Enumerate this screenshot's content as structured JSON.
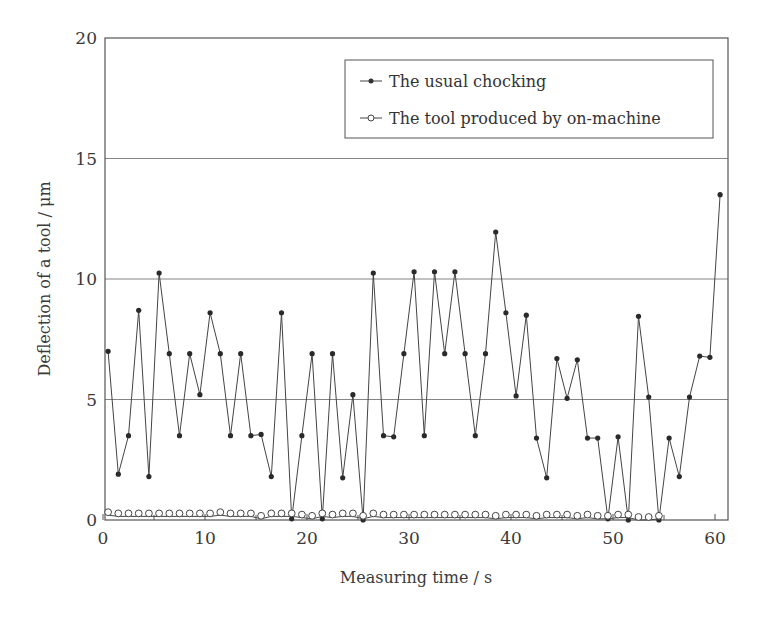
{
  "chart_data": {
    "type": "line",
    "title": "",
    "xlabel": "Measuring time / s",
    "ylabel": "Deflection of a tool / μm",
    "xlim": [
      0,
      61.2
    ],
    "ylim": [
      0,
      20
    ],
    "xticks": [
      0,
      10,
      20,
      30,
      40,
      50,
      60
    ],
    "xticks_minor": [
      5,
      15,
      25,
      35,
      45,
      55
    ],
    "yticks": [
      0,
      5,
      10,
      15,
      20
    ],
    "grid": "horizontal",
    "legend_position": "top-right",
    "series": [
      {
        "name": "The usual chocking",
        "marker": "filled-circle",
        "color": "#333333",
        "x": [
          0.5,
          1.5,
          2.5,
          3.5,
          4.5,
          5.5,
          6.5,
          7.5,
          8.5,
          9.5,
          10.5,
          11.5,
          12.5,
          13.5,
          14.5,
          15.5,
          16.5,
          17.5,
          18.5,
          19.5,
          20.5,
          21.5,
          22.5,
          23.5,
          24.5,
          25.5,
          26.5,
          27.5,
          28.5,
          29.5,
          30.5,
          31.5,
          32.5,
          33.5,
          34.5,
          35.5,
          36.5,
          37.5,
          38.5,
          39.5,
          40.5,
          41.5,
          42.5,
          43.5,
          44.5,
          45.5,
          46.5,
          47.5,
          48.5,
          49.5,
          50.5,
          51.5,
          52.5,
          53.5,
          54.5,
          55.5,
          56.5,
          57.5,
          58.5,
          59.5,
          60.5
        ],
        "values": [
          7.0,
          1.9,
          3.5,
          8.7,
          1.8,
          10.25,
          6.9,
          3.5,
          6.9,
          5.2,
          8.6,
          6.9,
          3.5,
          6.9,
          3.5,
          3.55,
          1.8,
          8.6,
          0.05,
          3.5,
          6.9,
          0.05,
          6.9,
          1.75,
          5.2,
          0.0,
          10.25,
          3.5,
          3.45,
          6.9,
          10.3,
          3.5,
          10.3,
          6.9,
          10.3,
          6.9,
          3.5,
          6.9,
          11.95,
          8.6,
          5.15,
          8.5,
          3.4,
          1.75,
          6.7,
          5.05,
          6.65,
          3.4,
          3.4,
          0.05,
          3.45,
          0.0,
          8.45,
          5.1,
          0.0,
          3.4,
          1.8,
          5.1,
          6.8,
          6.75,
          13.5
        ]
      },
      {
        "name": "The tool produced by on-machine",
        "marker": "open-circle",
        "color": "#333333",
        "x": [
          0.5,
          1.5,
          2.5,
          3.5,
          4.5,
          5.5,
          6.5,
          7.5,
          8.5,
          9.5,
          10.5,
          11.5,
          12.5,
          13.5,
          14.5,
          15.5,
          16.5,
          17.5,
          18.5,
          19.5,
          20.5,
          21.5,
          22.5,
          23.5,
          24.5,
          25.5,
          26.5,
          27.5,
          28.5,
          29.5,
          30.5,
          31.5,
          32.5,
          33.5,
          34.5,
          35.5,
          36.5,
          37.5,
          38.5,
          39.5,
          40.5,
          41.5,
          42.5,
          43.5,
          44.5,
          45.5,
          46.5,
          47.5,
          48.5,
          49.5,
          50.5,
          51.5,
          52.5,
          53.5,
          54.5
        ],
        "values": [
          0.2,
          0.15,
          0.15,
          0.15,
          0.15,
          0.15,
          0.15,
          0.15,
          0.15,
          0.15,
          0.15,
          0.2,
          0.15,
          0.15,
          0.15,
          0.05,
          0.15,
          0.15,
          0.15,
          0.1,
          0.05,
          0.15,
          0.1,
          0.15,
          0.15,
          0.05,
          0.15,
          0.1,
          0.1,
          0.1,
          0.1,
          0.1,
          0.1,
          0.1,
          0.1,
          0.1,
          0.1,
          0.1,
          0.05,
          0.1,
          0.1,
          0.1,
          0.05,
          0.1,
          0.1,
          0.1,
          0.05,
          0.1,
          0.05,
          0.05,
          0.1,
          0.1,
          0.0,
          0.0,
          0.05
        ]
      }
    ]
  }
}
